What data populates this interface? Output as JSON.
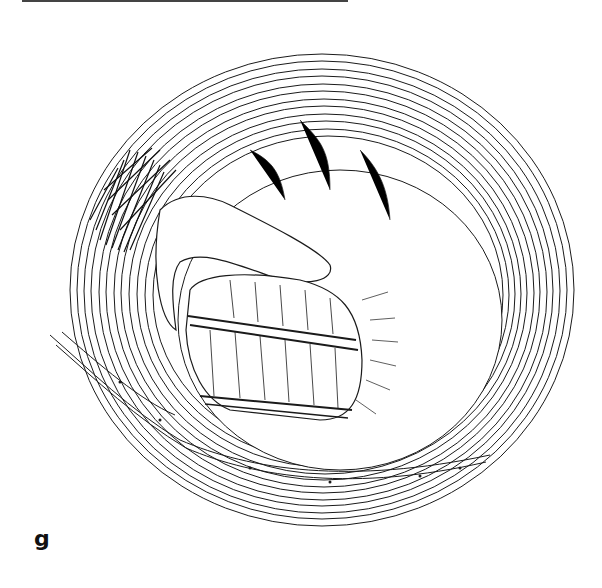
{
  "figure": {
    "panel_label": "g"
  },
  "colors": {
    "line": "#1a1a1a",
    "background": "#ffffff",
    "rule": "#444444"
  }
}
